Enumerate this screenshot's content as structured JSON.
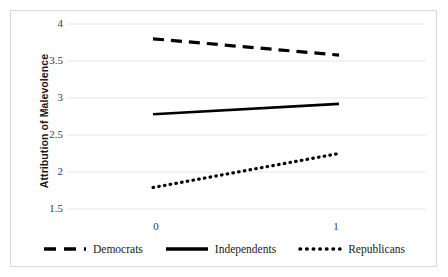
{
  "chart_data": {
    "type": "line",
    "title": "",
    "xlabel": "",
    "ylabel": "Attribution of Malevolence",
    "x": [
      0,
      1
    ],
    "xticklabels": [
      "0",
      "1"
    ],
    "yticklabels": [
      "4",
      "3.5",
      "3",
      "2.5",
      "2",
      "1.5"
    ],
    "yticks": [
      4,
      3.5,
      3,
      2.5,
      2,
      1.5
    ],
    "ylim": [
      1.5,
      4
    ],
    "xlim": [
      -0.25,
      1.25
    ],
    "grid": "horizontal",
    "legend_position": "bottom",
    "series": [
      {
        "name": "Democrats",
        "values": [
          3.8,
          3.58
        ],
        "style": "dashed",
        "color": "#000000"
      },
      {
        "name": "Independents",
        "values": [
          2.78,
          2.92
        ],
        "style": "solid",
        "color": "#000000"
      },
      {
        "name": "Republicans",
        "values": [
          1.79,
          2.25
        ],
        "style": "dotted",
        "color": "#000000"
      }
    ]
  },
  "axis": {
    "y_title": "Attribution of Malevolence",
    "y_ticks": [
      {
        "label": "4"
      },
      {
        "label": "3.5"
      },
      {
        "label": "3"
      },
      {
        "label": "2.5"
      },
      {
        "label": "2"
      },
      {
        "label": "1.5"
      }
    ],
    "x_ticks": [
      {
        "label": "0"
      },
      {
        "label": "1"
      }
    ]
  },
  "legend": {
    "items": [
      {
        "label": "Democrats",
        "style": "dashed"
      },
      {
        "label": "Independents",
        "style": "solid"
      },
      {
        "label": "Republicans",
        "style": "dotted"
      }
    ]
  },
  "colors": {
    "line": "#000000",
    "grid": "#e6e6e6",
    "border": "#d8d8d8",
    "tick_text": "#3b3b3b",
    "title_text": "#1a1a1a"
  }
}
